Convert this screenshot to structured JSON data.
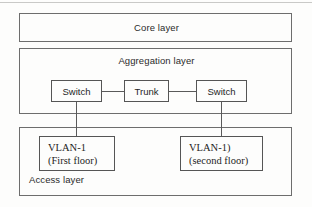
{
  "diagram": {
    "colors": {
      "border": "#6d6d6d",
      "node_border": "#555555",
      "connector": "#5a5a5a",
      "background": "#fdfdfc",
      "text": "#262626"
    },
    "layers": [
      {
        "id": "core",
        "label": "Core layer"
      },
      {
        "id": "aggregation",
        "label": "Aggregation layer"
      },
      {
        "id": "access",
        "label": "Access layer"
      }
    ],
    "nodes": [
      {
        "id": "switch-left",
        "label": "Switch"
      },
      {
        "id": "trunk",
        "label": "Trunk"
      },
      {
        "id": "switch-right",
        "label": "Switch"
      }
    ],
    "vlans": [
      {
        "id": "vlan-left",
        "name": "VLAN-1",
        "location": "(First floor)"
      },
      {
        "id": "vlan-right",
        "name": "VLAN-1)",
        "location": "(second floor)"
      }
    ]
  }
}
